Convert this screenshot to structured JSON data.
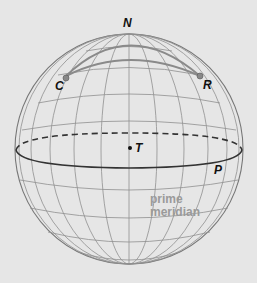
{
  "diagram": {
    "type": "globe",
    "labels": {
      "north_pole": "N",
      "point_c": "C",
      "point_r": "R",
      "point_t": "T",
      "point_p": "P",
      "prime_meridian_line1": "prime",
      "prime_meridian_line2": "meridian"
    },
    "elements": {
      "equator": "solid front / dashed back",
      "great_circle_arc": "C to R through near N",
      "latitude_arc": "C to R along parallel"
    },
    "colors": {
      "background": "#e6e6e6",
      "grid": "#8a8a8a",
      "equator": "#333333",
      "arc": "#888888",
      "prime_meridian_text": "#9a9a9a"
    }
  }
}
